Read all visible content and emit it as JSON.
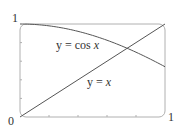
{
  "chart_data": {
    "type": "line",
    "title": "",
    "xlabel": "",
    "ylabel": "",
    "xlim": [
      0,
      1
    ],
    "ylim": [
      0,
      1
    ],
    "grid": false,
    "legend": null,
    "tick_labels": {
      "origin": "0",
      "x_max": "1",
      "y_max": "1"
    },
    "x_minor_ticks": [
      0.2,
      0.4,
      0.6,
      0.8
    ],
    "y_minor_ticks": [
      0.2,
      0.4,
      0.6,
      0.8
    ],
    "series": [
      {
        "name": "y = cos x",
        "label_prefix": "y = cos ",
        "label_var": "x",
        "x": [
          0,
          0.1,
          0.2,
          0.3,
          0.4,
          0.5,
          0.6,
          0.7,
          0.8,
          0.9,
          1.0
        ],
        "y": [
          1.0,
          0.995,
          0.98,
          0.955,
          0.921,
          0.878,
          0.825,
          0.765,
          0.697,
          0.622,
          0.54
        ]
      },
      {
        "name": "y = x",
        "label_prefix": "y = ",
        "label_var": "x",
        "x": [
          0,
          1
        ],
        "y": [
          0,
          1
        ]
      }
    ],
    "annotations": [
      {
        "text": "y = cos x",
        "series": 0
      },
      {
        "text": "y = x",
        "series": 1
      }
    ]
  },
  "colors": {
    "curve": "#555555",
    "frame": "#aaaaaa",
    "text": "#333333"
  }
}
